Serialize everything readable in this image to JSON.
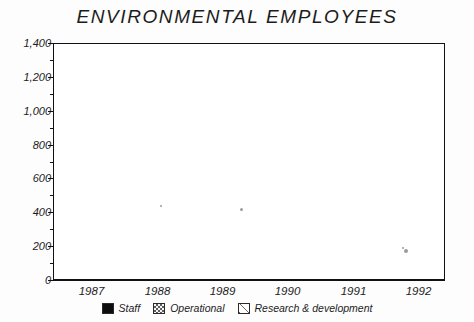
{
  "chart_data": {
    "type": "bar",
    "subtype": "stacked-vertical",
    "title": "ENVIRONMENTAL EMPLOYEES",
    "xlabel": "",
    "ylabel": "",
    "categories": [
      "1987",
      "1988",
      "1989",
      "1990",
      "1991",
      "1992"
    ],
    "series": [
      {
        "name": "Staff",
        "values": [
          600,
          670,
          600,
          630,
          520,
          510
        ]
      },
      {
        "name": "Operational",
        "values": [
          365,
          390,
          330,
          330,
          425,
          360
        ]
      },
      {
        "name": "Research & development",
        "values": [
          125,
          130,
          220,
          240,
          220,
          270
        ]
      }
    ],
    "totals": [
      1090,
      1190,
      1150,
      1200,
      1165,
      1140
    ],
    "ylim": [
      0,
      1400
    ],
    "ytick_values": [
      0,
      200,
      400,
      600,
      800,
      1000,
      1200,
      1400
    ],
    "ytick_labels": [
      "0",
      "200",
      "400",
      "600",
      "800",
      "1,000",
      "1,200",
      "1,400"
    ],
    "grid": true,
    "grid_style": "dashed-horizontal",
    "legend_position": "bottom-center",
    "legend": [
      {
        "label": "Staff",
        "pattern": "solid-black"
      },
      {
        "label": "Operational",
        "pattern": "checkerboard"
      },
      {
        "label": "Research & development",
        "pattern": "diagonal-hatch"
      }
    ]
  },
  "colors": {
    "staff": "#0d0d0d",
    "operational": "#5e5e5e",
    "rnd": "#6a6a6a",
    "frame": "#111111",
    "grid": "#9a9a9a",
    "background": "#fdfdfd"
  }
}
